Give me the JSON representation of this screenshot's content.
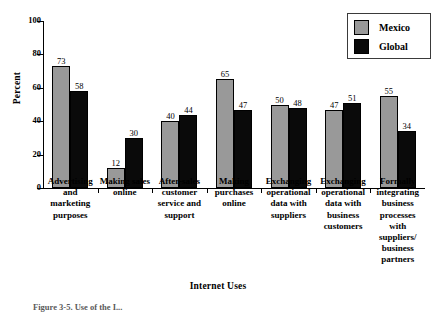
{
  "chart_data": {
    "type": "bar",
    "title": "",
    "xlabel": "Internet Uses",
    "ylabel": "Percent",
    "ylim": [
      0,
      100
    ],
    "yticks": [
      0,
      20,
      40,
      60,
      80,
      100
    ],
    "grid": false,
    "legend_position": "top-right",
    "categories": [
      "Advertising and marketing purposes",
      "Making sales online",
      "After-sales customer service and support",
      "Making purchases online",
      "Exchanging operational data with suppliers",
      "Exchanging operational data with business customers",
      "Formally integrating business processes with suppliers/ business partners"
    ],
    "category_lines": [
      [
        "Advertising",
        "and",
        "marketing",
        "purposes"
      ],
      [
        "Making sales",
        "online"
      ],
      [
        "After-sales",
        "customer",
        "service and",
        "support"
      ],
      [
        "Making",
        "purchases",
        "online"
      ],
      [
        "Exchanging",
        "operational",
        "data with",
        "suppliers"
      ],
      [
        "Exchanging",
        "operational",
        "data with",
        "business",
        "customers"
      ],
      [
        "Formally",
        "integrating",
        "business",
        "processes",
        "with",
        "suppliers/",
        "business",
        "partners"
      ]
    ],
    "series": [
      {
        "name": "Mexico",
        "color": "#999999",
        "values": [
          73,
          12,
          40,
          65,
          50,
          47,
          55
        ]
      },
      {
        "name": "Global",
        "color": "#0a0a0a",
        "values": [
          58,
          30,
          44,
          47,
          48,
          51,
          34
        ]
      }
    ]
  },
  "legend": {
    "items": [
      {
        "label": "Mexico",
        "color": "#999999"
      },
      {
        "label": "Global",
        "color": "#0a0a0a"
      }
    ]
  },
  "caption": {
    "text": "Figure 3-5. Use of the I..."
  }
}
